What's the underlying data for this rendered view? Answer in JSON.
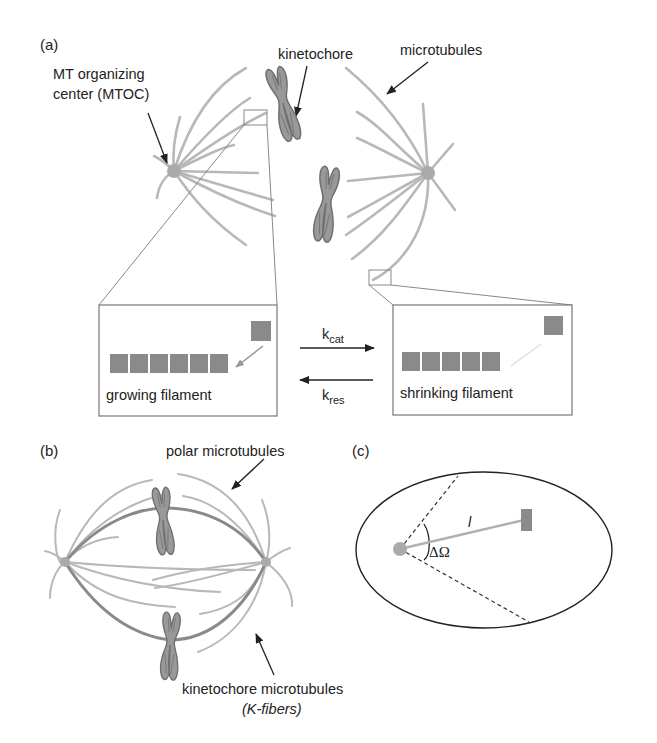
{
  "figure": {
    "panel_a": {
      "label": "(a)",
      "mtoc_label_line1": "MT organizing",
      "mtoc_label_line2": "center (MTOC)",
      "kinetochore_label": "kinetochore",
      "microtubules_label": "microtubules",
      "growing_box": {
        "caption": "growing filament",
        "monomer_count": 6
      },
      "shrinking_box": {
        "caption": "shrinking filament",
        "monomer_count": 5
      },
      "forward_rate": {
        "base": "k",
        "sub": "cat"
      },
      "reverse_rate": {
        "base": "k",
        "sub": "res"
      }
    },
    "panel_b": {
      "label": "(b)",
      "polar_label": "polar microtubules",
      "kfiber_label_line1": "kinetochore microtubules",
      "kfiber_label_line2": "(K-fibers)"
    },
    "panel_c": {
      "label": "(c)",
      "length_label": "l",
      "angle_label": "ΔΩ"
    },
    "colors": {
      "microtubule": "#b8b8b8",
      "monomer": "#8a8a8a",
      "chromosome": "#999999",
      "kfiber": "#8a8a8a",
      "text": "#222222"
    }
  }
}
